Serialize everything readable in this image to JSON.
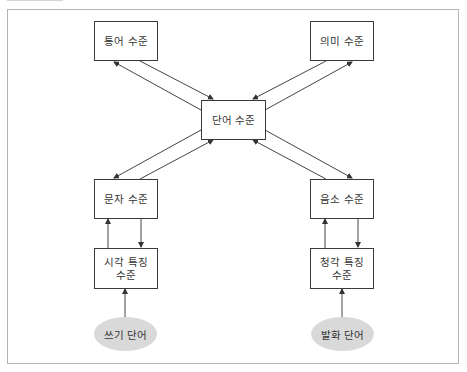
{
  "diagram": {
    "nodes": {
      "syntax": {
        "label": "통어 수준",
        "shape": "box"
      },
      "semantic": {
        "label": "의미 수준",
        "shape": "box"
      },
      "word": {
        "label": "단어 수준",
        "shape": "box"
      },
      "letter": {
        "label": "문자 수준",
        "shape": "box"
      },
      "phoneme": {
        "label": "음소 수준",
        "shape": "box"
      },
      "visual_feature": {
        "label": "시각 특징\n수준",
        "shape": "box"
      },
      "auditory_feature": {
        "label": "청각 특징\n수준",
        "shape": "box"
      },
      "written_word": {
        "label": "쓰기 단어",
        "shape": "ellipse"
      },
      "spoken_word": {
        "label": "발화 단어",
        "shape": "ellipse"
      }
    },
    "edges": [
      {
        "from": "word",
        "to": "syntax"
      },
      {
        "from": "syntax",
        "to": "word"
      },
      {
        "from": "word",
        "to": "semantic"
      },
      {
        "from": "semantic",
        "to": "word"
      },
      {
        "from": "word",
        "to": "letter"
      },
      {
        "from": "letter",
        "to": "word"
      },
      {
        "from": "word",
        "to": "phoneme"
      },
      {
        "from": "phoneme",
        "to": "word"
      },
      {
        "from": "visual_feature",
        "to": "letter"
      },
      {
        "from": "letter",
        "to": "visual_feature"
      },
      {
        "from": "auditory_feature",
        "to": "phoneme"
      },
      {
        "from": "phoneme",
        "to": "auditory_feature"
      },
      {
        "from": "written_word",
        "to": "visual_feature"
      },
      {
        "from": "spoken_word",
        "to": "auditory_feature"
      }
    ],
    "colors": {
      "box_border": "#3a3a3a",
      "ellipse_fill": "#d9d9d9",
      "text": "#333333",
      "frame": "#b4b4b4"
    }
  }
}
